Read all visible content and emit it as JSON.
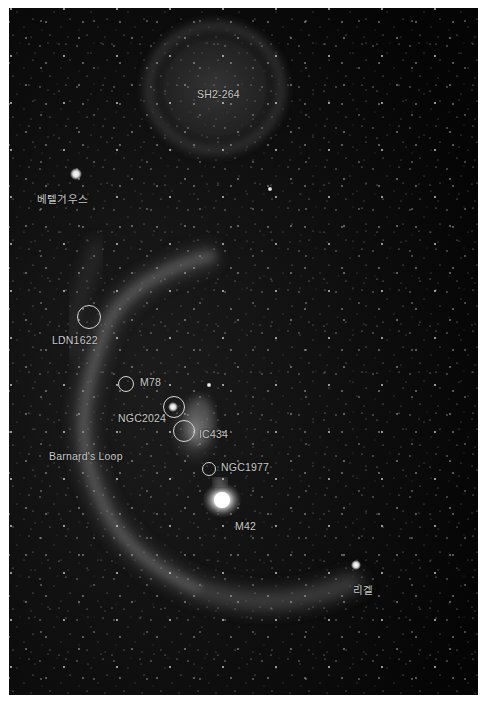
{
  "image": {
    "description": "Wide-field monochrome astrophotograph of the Orion region showing Barnard's Loop and labeled deep-sky objects",
    "background_color": "#0a0a0a",
    "label_color": "#c8c8c8",
    "border_color": "#ffffff"
  },
  "labels": [
    {
      "id": "sh2-264",
      "text": "SH2-264",
      "x": 197,
      "y": 88
    },
    {
      "id": "betelgeuse",
      "text": "베텔기우스",
      "x": 37,
      "y": 191
    },
    {
      "id": "ldn1622",
      "text": "LDN1622",
      "x": 52,
      "y": 334
    },
    {
      "id": "m78",
      "text": "M78",
      "x": 140,
      "y": 376
    },
    {
      "id": "ngc2024",
      "text": "NGC2024",
      "x": 118,
      "y": 412
    },
    {
      "id": "ic434",
      "text": "IC434",
      "x": 199,
      "y": 428
    },
    {
      "id": "barnards-loop",
      "text": "Barnard's Loop",
      "x": 49,
      "y": 450
    },
    {
      "id": "ngc1977",
      "text": "NGC1977",
      "x": 221,
      "y": 461
    },
    {
      "id": "m42",
      "text": "M42",
      "x": 235,
      "y": 520
    },
    {
      "id": "rigel",
      "text": "리겔",
      "x": 353,
      "y": 582
    }
  ],
  "markers": [
    {
      "id": "ldn1622-circle",
      "cx": 89,
      "cy": 317,
      "r": 12
    },
    {
      "id": "m78-circle",
      "cx": 126,
      "cy": 384,
      "r": 8
    },
    {
      "id": "ngc2024-circle",
      "cx": 174,
      "cy": 407,
      "r": 11
    },
    {
      "id": "ic434-circle",
      "cx": 184,
      "cy": 431,
      "r": 11
    },
    {
      "id": "ngc1977-circle",
      "cx": 209,
      "cy": 469,
      "r": 7
    }
  ],
  "bright_stars": [
    {
      "id": "betelgeuse-star",
      "x": 76,
      "y": 174,
      "size": 5
    },
    {
      "id": "rigel-star",
      "x": 356,
      "y": 565,
      "size": 4
    },
    {
      "id": "m42-core",
      "x": 222,
      "y": 500,
      "size": 14
    },
    {
      "id": "ngc2024-star",
      "x": 173,
      "y": 407,
      "size": 4
    }
  ]
}
